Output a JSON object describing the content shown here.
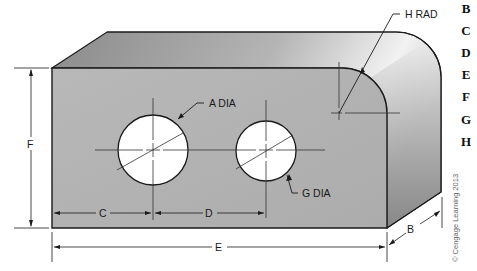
{
  "diagram": {
    "type": "isometric-technical-drawing",
    "labels": {
      "hole_large": "A DIA",
      "hole_small": "G DIA",
      "corner_radius": "H RAD",
      "depth": "B",
      "hole_offset": "C",
      "hole_spacing": "D",
      "overall_length": "E",
      "height": "F"
    },
    "colors": {
      "front_face": "#b3b3b3",
      "top_face_dark": "#8a8a8a",
      "top_face_light": "#f0f0f0",
      "side_face_dark": "#7a7a7a",
      "side_face_light": "#c8c8c8",
      "hole_fill": "#ffffff",
      "outline": "#1a1a1a"
    }
  },
  "answer_letters": [
    "B",
    "C",
    "D",
    "E",
    "F",
    "G",
    "H"
  ],
  "copyright": "© Cengage Learning 2013"
}
